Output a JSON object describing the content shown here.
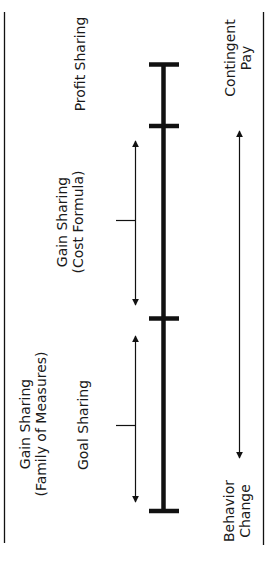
{
  "diagram": {
    "type": "continuum",
    "orientation": "vertical (rotated 90° counter-clockwise)",
    "colors": {
      "line": "#111111",
      "text": "#1a1a1a",
      "background": "#ffffff"
    },
    "segments": [
      {
        "label_line1": "Profit Sharing",
        "label_line2": ""
      },
      {
        "label_line1": "Gain Sharing",
        "label_line2": "(Cost Formula)"
      },
      {
        "label_line1": "Gain Sharing",
        "label_line2": "(Family of Measures)"
      },
      {
        "label_line1": "Goal Sharing",
        "label_line2": ""
      }
    ],
    "axis": {
      "top_label_line1": "Contingent",
      "top_label_line2": "Pay",
      "bottom_label_line1": "Behavior",
      "bottom_label_line2": "Change"
    }
  }
}
